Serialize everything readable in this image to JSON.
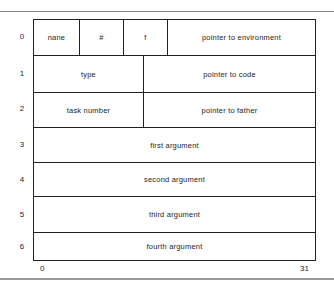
{
  "diagram": {
    "type": "memory word layout (task frame)",
    "rows": [
      {
        "index": "0",
        "fields": [
          "nane",
          "#",
          "f",
          "pointer to environment"
        ]
      },
      {
        "index": "1",
        "fields": [
          "type",
          "pointer to code"
        ]
      },
      {
        "index": "2",
        "fields": [
          "task number",
          "pointer to father"
        ]
      },
      {
        "index": "3",
        "fields": [
          "first argument"
        ]
      },
      {
        "index": "4",
        "fields": [
          "second argument"
        ]
      },
      {
        "index": "5",
        "fields": [
          "third argument"
        ]
      },
      {
        "index": "6",
        "fields": [
          "fourth argument"
        ]
      }
    ],
    "bit_axis": {
      "start": "0",
      "end": "31"
    }
  }
}
